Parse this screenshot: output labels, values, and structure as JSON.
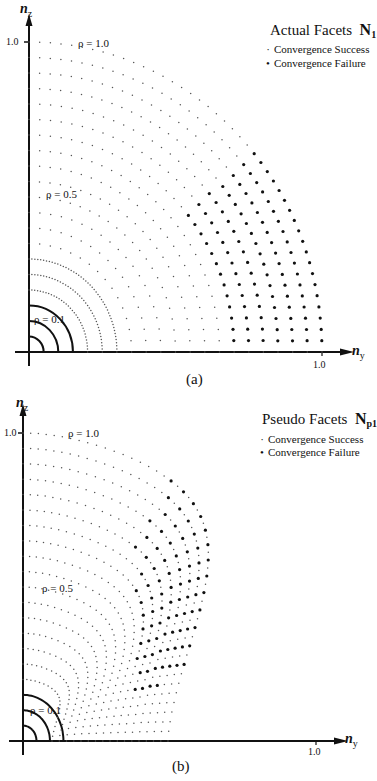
{
  "chart_data": [
    {
      "type": "scatter",
      "panel": "(a)",
      "title": "Actual Facets N1",
      "title_main": "Actual Facets",
      "title_symbol": "N",
      "title_subscript": "1",
      "xlabel": "n_y",
      "ylabel": "n_z",
      "xlabel_main": "n",
      "xlabel_sub": "y",
      "ylabel_main": "n",
      "ylabel_sub": "z",
      "xlim": [
        0,
        1.0
      ],
      "ylim": [
        0,
        1.0
      ],
      "x_ticks": [
        "1.0"
      ],
      "y_ticks": [
        "1.0"
      ],
      "grid": false,
      "legend_position": "upper right",
      "legend": [
        {
          "marker": "small-dot",
          "label": "Convergence Success"
        },
        {
          "marker": "large-dot",
          "label": "Convergence Failure"
        }
      ],
      "annotations": [
        {
          "text": "ρ = 1.0",
          "rho": 1.0
        },
        {
          "text": "ρ = 0.5",
          "rho": 0.5
        },
        {
          "text": "ρ = 0.1",
          "rho": 0.1
        }
      ],
      "description": "Points sampled on concentric quarter circles of radius rho = 0.05 to 1.0 (step 0.05) in the (n_y, n_z) plane. All converge except the outer rings (rho >= 0.7) near the n_y axis (angle below ~40 deg), which fail.",
      "rings_rho": [
        0.05,
        0.1,
        0.15,
        0.2,
        0.25,
        0.3,
        0.35,
        0.4,
        0.45,
        0.5,
        0.55,
        0.6,
        0.65,
        0.7,
        0.75,
        0.8,
        0.85,
        0.9,
        0.95,
        1.0
      ],
      "failure_region": {
        "rho_min": 0.7,
        "angle_max_deg": 40
      }
    },
    {
      "type": "scatter",
      "panel": "(b)",
      "title": "Pseudo Facets Np1",
      "title_main": "Pseudo Facets",
      "title_symbol": "N",
      "title_subscript": "p1",
      "xlabel": "n_y",
      "ylabel": "n_z",
      "xlabel_main": "n",
      "xlabel_sub": "y",
      "ylabel_main": "n",
      "ylabel_sub": "z",
      "xlim": [
        0,
        1.0
      ],
      "ylim": [
        0,
        1.0
      ],
      "x_ticks": [
        "1.0"
      ],
      "y_ticks": [
        "1.0"
      ],
      "grid": false,
      "legend_position": "upper right",
      "legend": [
        {
          "marker": "small-dot",
          "label": "Convergence Success"
        },
        {
          "marker": "large-dot",
          "label": "Convergence Failure"
        }
      ],
      "annotations": [
        {
          "text": "ρ = 1.0",
          "rho": 1.0
        },
        {
          "text": "ρ = 0.5",
          "rho": 0.5
        },
        {
          "text": "ρ = 0.1",
          "rho": 0.1
        }
      ],
      "description": "Distorted (pseudo-facet) curves: the rings are compressed in n_y at low n_z and bulge out to n_y ~0.65 near n_z ~0.75. Failures cluster along the outer fold of the curves (a diagonal band from about (0.40,0.15) to (0.62,0.78)).",
      "rings_rho": [
        0.05,
        0.1,
        0.15,
        0.2,
        0.25,
        0.3,
        0.35,
        0.4,
        0.45,
        0.5,
        0.55,
        0.6,
        0.65,
        0.7,
        0.75,
        0.8,
        0.85,
        0.9,
        0.95,
        1.0
      ],
      "max_ny_extent": 0.66
    }
  ],
  "captions": {
    "a": "(a)",
    "b": "(b)"
  },
  "panel_a": {
    "title_main": "Actual Facets",
    "title_symbol": "N",
    "title_sub": "1",
    "legend_success": "Convergence  Success",
    "legend_failure": "Convergence  Failure",
    "legend_success_marker": "·",
    "legend_failure_marker": "•",
    "rho_1": "ρ = 1.0",
    "rho_05": "ρ = 0.5",
    "rho_01": "ρ = 0.1",
    "y_tick": "1.0",
    "x_tick": "1.0",
    "y_axis_main": "n",
    "y_axis_sub": "z",
    "x_axis_main": "n",
    "x_axis_sub": "y"
  },
  "panel_b": {
    "title_main": "Pseudo Facets",
    "title_symbol": "N",
    "title_sub": "p1",
    "legend_success": "Convergence  Success",
    "legend_failure": "Convergence  Failure",
    "legend_success_marker": "·",
    "legend_failure_marker": "•",
    "rho_1": "ρ = 1.0",
    "rho_05": "ρ = 0.5",
    "rho_01": "ρ = 0.1",
    "y_tick": "1.0",
    "x_tick": "1.0",
    "y_axis_main": "n",
    "y_axis_sub": "z",
    "x_axis_main": "n",
    "x_axis_sub": "y"
  },
  "colors": {
    "ink": "#111111",
    "success": "#555555",
    "failure": "#111111",
    "background": "#ffffff"
  }
}
